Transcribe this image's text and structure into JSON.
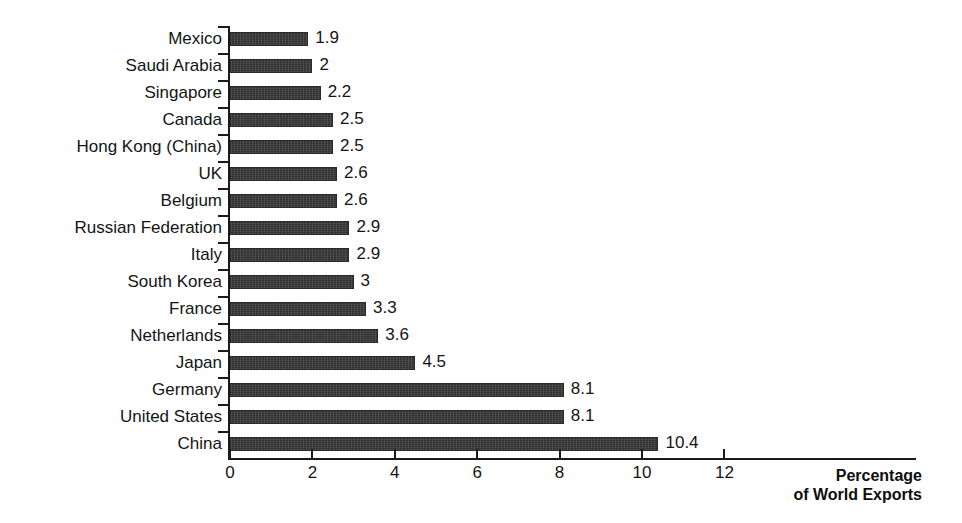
{
  "chart_data": {
    "type": "bar",
    "orientation": "horizontal",
    "title": "",
    "subtitle": "",
    "xlabel": "Percentage of World Exports",
    "ylabel": "",
    "xlim": [
      0,
      12
    ],
    "xticks": [
      0,
      2,
      4,
      6,
      8,
      10,
      12
    ],
    "xtick_labels": [
      "0",
      "2",
      "4",
      "6",
      "8",
      "10",
      "12"
    ],
    "grid": false,
    "legend": null,
    "bar_color": "#3b3b3b",
    "categories": [
      "Mexico",
      "Saudi Arabia",
      "Singapore",
      "Canada",
      "Hong Kong (China)",
      "UK",
      "Belgium",
      "Russian Federation",
      "Italy",
      "South Korea",
      "France",
      "Netherlands",
      "Japan",
      "Germany",
      "United States",
      "China"
    ],
    "values": [
      1.9,
      2,
      2.2,
      2.5,
      2.5,
      2.6,
      2.6,
      2.9,
      2.9,
      3,
      3.3,
      3.6,
      4.5,
      8.1,
      8.1,
      10.4
    ],
    "value_labels": [
      "1.9",
      "2",
      "2.2",
      "2.5",
      "2.5",
      "2.6",
      "2.6",
      "2.9",
      "2.9",
      "3",
      "3.3",
      "3.6",
      "4.5",
      "8.1",
      "8.1",
      "10.4"
    ]
  },
  "axis_title": {
    "line1": "Percentage",
    "line2": "of World Exports"
  }
}
